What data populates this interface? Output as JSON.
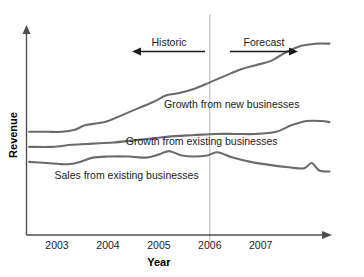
{
  "chart_data": {
    "type": "line",
    "title": "",
    "xlabel": "Year",
    "ylabel": "Revenue",
    "grid": false,
    "legend_position": "inline-labels",
    "xlim": [
      2002.4,
      2008.4
    ],
    "ylim": [
      0,
      100
    ],
    "x_tick_labels": [
      "2003",
      "2004",
      "2005",
      "2006",
      "2007"
    ],
    "x_ticks": [
      2003,
      2004,
      2005,
      2006,
      2007
    ],
    "y_tick_labels": [],
    "annotations": [
      {
        "name": "historic",
        "label": "Historic",
        "direction": "left",
        "from_year": 2005.9,
        "to_year": 2004.4
      },
      {
        "name": "forecast",
        "label": "Forecast",
        "direction": "right",
        "from_year": 2006.2,
        "to_year": 2007.6
      },
      {
        "name": "divider",
        "label": "",
        "year": 2006
      }
    ],
    "series": [
      {
        "name": "growth-from-new-businesses",
        "label": "Growth from new businesses",
        "label_x": 2005.1,
        "label_y": 59,
        "x": [
          2002.45,
          2002.8,
          2003.1,
          2003.35,
          2003.55,
          2003.8,
          2004.0,
          2004.3,
          2004.6,
          2004.9,
          2005.15,
          2005.4,
          2005.7,
          2006.0,
          2006.3,
          2006.6,
          2006.9,
          2007.2,
          2007.5,
          2007.8,
          2008.1,
          2008.35
        ],
        "y": [
          48,
          48,
          48,
          49,
          51,
          52,
          53,
          56,
          59,
          62,
          65,
          66,
          68,
          71,
          74,
          77,
          79,
          81,
          85,
          88,
          89,
          89
        ]
      },
      {
        "name": "growth-from-existing-businesses",
        "label": "Growth from existing businesses",
        "label_x": 2004.35,
        "label_y": 42,
        "x": [
          2002.45,
          2002.9,
          2003.3,
          2003.7,
          2004.1,
          2004.5,
          2004.9,
          2005.3,
          2005.7,
          2006.1,
          2006.5,
          2006.9,
          2007.3,
          2007.6,
          2007.9,
          2008.2,
          2008.35
        ],
        "y": [
          41,
          41,
          42,
          42.5,
          43,
          44,
          45,
          46,
          46.5,
          47,
          47,
          47,
          48,
          51,
          53,
          53,
          52.5
        ]
      },
      {
        "name": "sales-from-existing-businesses",
        "label": "Sales from existing businesses",
        "label_x": 2002.95,
        "label_y": 26,
        "x": [
          2002.45,
          2002.8,
          2003.05,
          2003.25,
          2003.45,
          2003.7,
          2004.0,
          2004.4,
          2004.75,
          2005.0,
          2005.2,
          2005.45,
          2005.7,
          2005.95,
          2006.15,
          2006.45,
          2006.8,
          2007.2,
          2007.55,
          2007.85,
          2008.0,
          2008.15,
          2008.35
        ],
        "y": [
          34,
          33.5,
          33,
          33,
          34,
          36,
          36.5,
          36.5,
          36,
          37.5,
          39,
          37,
          36.5,
          37,
          38.5,
          36,
          34,
          32.5,
          31.5,
          31,
          33.5,
          30,
          29.5
        ]
      }
    ]
  }
}
